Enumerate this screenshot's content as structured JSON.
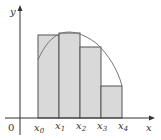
{
  "diagram": {
    "type": "riemann-sum",
    "axes": {
      "x_label": "x",
      "y_label": "y",
      "origin_label": "0"
    },
    "ticks": [
      {
        "base": "x",
        "sub": "0"
      },
      {
        "base": "x",
        "sub": "1"
      },
      {
        "base": "x",
        "sub": "2"
      },
      {
        "base": "x",
        "sub": "3"
      },
      {
        "base": "x",
        "sub": "4"
      }
    ],
    "rectangles": 4,
    "colors": {
      "fill": "#d9d9d9",
      "stroke": "#555555",
      "curve": "#777777",
      "axis": "#333333"
    }
  }
}
